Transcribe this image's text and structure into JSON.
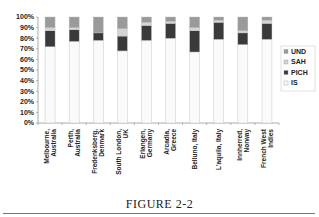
{
  "chart_data": {
    "type": "bar",
    "stacked": true,
    "percent": true,
    "title": "",
    "xlabel": "",
    "ylabel": "",
    "ylim": [
      0,
      100
    ],
    "yticks": [
      "0%",
      "10%",
      "20%",
      "30%",
      "40%",
      "50%",
      "60%",
      "70%",
      "80%",
      "90%",
      "100%"
    ],
    "grid": false,
    "legend_position": "right",
    "categories": [
      [
        "Melbourne,",
        "Australia"
      ],
      [
        "Perth,",
        "Australia"
      ],
      [
        "Fredenksberg,",
        "Denmark"
      ],
      [
        "South London,",
        "UK"
      ],
      [
        "Erlangen,",
        "Germany"
      ],
      [
        "Arcadia,",
        "Greece"
      ],
      [
        "Belluno, Italy"
      ],
      [
        "L'aquila, Italy"
      ],
      [
        "Innherred,",
        "Norway"
      ],
      [
        "French West",
        "Indies"
      ]
    ],
    "series": [
      {
        "name": "IS",
        "color": "#fafafa",
        "values": [
          72,
          77,
          78,
          68,
          78,
          80,
          67,
          79,
          74,
          79
        ]
      },
      {
        "name": "PICH",
        "color": "#3a3a3a",
        "values": [
          15,
          11,
          7,
          14,
          14,
          14,
          20,
          16,
          11,
          15
        ]
      },
      {
        "name": "SAH",
        "color": "#d4d4d4",
        "values": [
          3,
          2,
          0,
          7,
          3,
          2,
          3,
          2,
          2,
          3
        ]
      },
      {
        "name": "UND",
        "color": "#9a9a9a",
        "values": [
          10,
          10,
          15,
          11,
          5,
          4,
          10,
          3,
          13,
          3
        ]
      }
    ],
    "legend": [
      "UND",
      "SAH",
      "PICH",
      "IS"
    ]
  },
  "caption": "FIGURE 2-2"
}
